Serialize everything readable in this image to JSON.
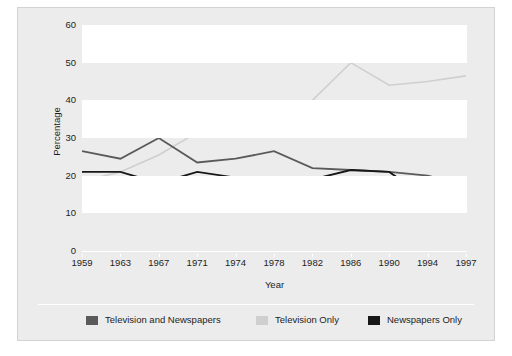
{
  "figure": {
    "background_color": "#ececec",
    "border_color": "#d2d2d2",
    "band_color": "#ffffff",
    "axis_color": "#ffffff"
  },
  "axes": {
    "y_title": "Percentage",
    "x_title": "Year",
    "y_ticks": [
      "0",
      "10",
      "20",
      "30",
      "40",
      "50",
      "60"
    ],
    "x_ticks": [
      "1959",
      "1963",
      "1967",
      "1971",
      "1974",
      "1978",
      "1982",
      "1986",
      "1990",
      "1994",
      "1997"
    ]
  },
  "legend": {
    "items": [
      {
        "label": "Television and Newspapers",
        "color": "#5a5a5a"
      },
      {
        "label": "Television Only",
        "color": "#cfcfcf"
      },
      {
        "label": "Newspapers Only",
        "color": "#171717"
      }
    ]
  },
  "chart_data": {
    "type": "line",
    "title": "",
    "xlabel": "Year",
    "ylabel": "Percentage",
    "categories": [
      "1959",
      "1963",
      "1967",
      "1971",
      "1974",
      "1978",
      "1982",
      "1986",
      "1990",
      "1994",
      "1997"
    ],
    "x": [
      1959,
      1963,
      1967,
      1971,
      1974,
      1978,
      1982,
      1986,
      1990,
      1994,
      1997
    ],
    "ylim": [
      0,
      60
    ],
    "yticks": [
      0,
      10,
      20,
      30,
      40,
      50,
      60
    ],
    "grid": false,
    "banded_background": true,
    "legend_position": "bottom",
    "series": [
      {
        "name": "Television and Newspapers",
        "color": "#5a5a5a",
        "values": [
          26.5,
          24.5,
          30.0,
          23.5,
          24.5,
          26.5,
          22.0,
          21.5,
          21.0,
          20.0,
          17.5
        ]
      },
      {
        "name": "Television Only",
        "color": "#cfcfcf",
        "values": [
          18.5,
          21.0,
          25.5,
          31.5,
          35.5,
          34.0,
          40.0,
          50.0,
          44.0,
          45.0,
          46.5
        ]
      },
      {
        "name": "Newspapers Only",
        "color": "#171717",
        "values": [
          21.0,
          21.0,
          18.0,
          21.0,
          19.5,
          19.0,
          19.0,
          21.5,
          21.0,
          14.0,
          17.5
        ]
      }
    ]
  }
}
